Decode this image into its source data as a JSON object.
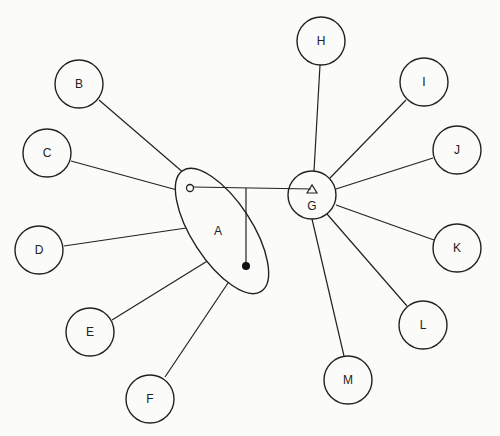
{
  "diagram": {
    "type": "network-graph",
    "hubs": {
      "A": {
        "label": "A",
        "shape": "ellipse",
        "cx": 222,
        "cy": 231,
        "rx": 30,
        "ry": 72,
        "rotate": -33,
        "label_x": 218,
        "label_y": 235
      },
      "G": {
        "label": "G",
        "shape": "circle",
        "cx": 312,
        "cy": 195,
        "r": 24,
        "label_x": 312,
        "label_y": 210
      }
    },
    "nodes": [
      {
        "id": "B",
        "label": "B",
        "cx": 79,
        "cy": 84,
        "r": 24
      },
      {
        "id": "C",
        "label": "C",
        "cx": 47,
        "cy": 153,
        "r": 24
      },
      {
        "id": "D",
        "label": "D",
        "cx": 39,
        "cy": 250,
        "r": 24
      },
      {
        "id": "E",
        "label": "E",
        "cx": 90,
        "cy": 332,
        "r": 24
      },
      {
        "id": "F",
        "label": "F",
        "cx": 150,
        "cy": 399,
        "r": 24
      },
      {
        "id": "H",
        "label": "H",
        "cx": 321,
        "cy": 41,
        "r": 24
      },
      {
        "id": "I",
        "label": "I",
        "cx": 424,
        "cy": 82,
        "r": 24
      },
      {
        "id": "J",
        "label": "J",
        "cx": 457,
        "cy": 150,
        "r": 24
      },
      {
        "id": "K",
        "label": "K",
        "cx": 457,
        "cy": 248,
        "r": 24
      },
      {
        "id": "L",
        "label": "L",
        "cx": 423,
        "cy": 325,
        "r": 24
      },
      {
        "id": "M",
        "label": "M",
        "cx": 348,
        "cy": 380,
        "r": 24
      }
    ],
    "edges": [
      {
        "from": "B",
        "to": "A",
        "x1": 99,
        "y1": 100,
        "x2": 185,
        "y2": 174
      },
      {
        "from": "C",
        "to": "A",
        "x1": 71,
        "y1": 161,
        "x2": 177,
        "y2": 190
      },
      {
        "from": "D",
        "to": "A",
        "x1": 64,
        "y1": 246,
        "x2": 193,
        "y2": 227
      },
      {
        "from": "E",
        "to": "A",
        "x1": 112,
        "y1": 320,
        "x2": 209,
        "y2": 260
      },
      {
        "from": "F",
        "to": "A",
        "x1": 165,
        "y1": 377,
        "x2": 232,
        "y2": 277
      },
      {
        "from": "H",
        "to": "G",
        "x1": 320,
        "y1": 65,
        "x2": 314,
        "y2": 171
      },
      {
        "from": "I",
        "to": "G",
        "x1": 406,
        "y1": 100,
        "x2": 330,
        "y2": 178
      },
      {
        "from": "J",
        "to": "G",
        "x1": 433,
        "y1": 158,
        "x2": 336,
        "y2": 189
      },
      {
        "from": "K",
        "to": "G",
        "x1": 434,
        "y1": 240,
        "x2": 336,
        "y2": 205
      },
      {
        "from": "L",
        "to": "G",
        "x1": 407,
        "y1": 306,
        "x2": 327,
        "y2": 214
      },
      {
        "from": "M",
        "to": "G",
        "x1": 344,
        "y1": 356,
        "x2": 312,
        "y2": 219
      }
    ],
    "connector": {
      "horizontal": {
        "x1": 193,
        "y1": 187,
        "x2": 311,
        "y2": 189
      },
      "vertical": {
        "x1": 246,
        "y1": 188,
        "x2": 246,
        "y2": 265
      },
      "open_circle": {
        "cx": 190,
        "cy": 188,
        "r": 3.5
      },
      "filled_dot": {
        "cx": 246,
        "cy": 266,
        "r": 4
      },
      "triangle": {
        "points": "307,193 312,185 317,193"
      }
    }
  }
}
